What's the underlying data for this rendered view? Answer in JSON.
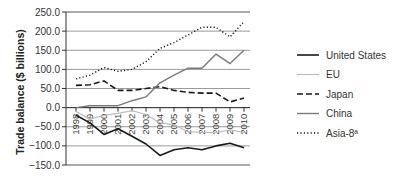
{
  "chart_data": {
    "type": "line",
    "title": "",
    "xlabel": "",
    "ylabel": "Trade balance ($ billions)",
    "ylim": [
      -150,
      250
    ],
    "yticks": [
      "250.0",
      "200.0",
      "150.0",
      "100.0",
      "50.0",
      "0.0",
      "-50.0",
      "-100.0",
      "-150.0"
    ],
    "ytick_values": [
      250,
      200,
      150,
      100,
      50,
      0,
      -50,
      -100,
      -150
    ],
    "grid": true,
    "legend_position": "right",
    "x": [
      "1998",
      "1999",
      "2000",
      "2001",
      "2002",
      "2003",
      "2004",
      "2005",
      "2006",
      "2007",
      "2008",
      "2009",
      "2010"
    ],
    "series": [
      {
        "name": "United States",
        "style": "solid",
        "color": "#1a1a1a",
        "width": 1.6,
        "values": [
          -20,
          -40,
          -70,
          -55,
          -75,
          -95,
          -125,
          -110,
          -105,
          -110,
          -100,
          -93,
          -105
        ]
      },
      {
        "name": "EU",
        "style": "solid",
        "color": "#bdbdbd",
        "width": 1.2,
        "values": [
          -10,
          -30,
          -20,
          -15,
          -8,
          -18,
          -40,
          -45,
          -63,
          -65,
          -65,
          -58,
          -65
        ]
      },
      {
        "name": "Japan",
        "style": "dashed",
        "color": "#1a1a1a",
        "width": 1.6,
        "values": [
          58,
          60,
          70,
          45,
          45,
          50,
          55,
          45,
          40,
          38,
          38,
          15,
          25
        ]
      },
      {
        "name": "China",
        "style": "solid",
        "color": "#7a7a7a",
        "width": 1.4,
        "values": [
          0,
          5,
          5,
          5,
          18,
          28,
          65,
          85,
          103,
          103,
          140,
          115,
          150
        ]
      },
      {
        "name": "Asia-8ª",
        "style": "dotted",
        "color": "#1a1a1a",
        "width": 1.4,
        "values": [
          75,
          85,
          105,
          95,
          100,
          120,
          155,
          170,
          190,
          210,
          210,
          185,
          225
        ]
      }
    ]
  }
}
